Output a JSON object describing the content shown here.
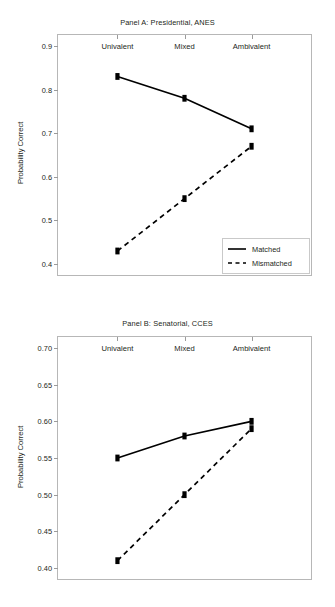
{
  "figure": {
    "background": "#ffffff",
    "line_color": "#000000",
    "axis_color": "#b7b7b7"
  },
  "panels": [
    {
      "id": "panel-a",
      "title": "Panel A: Presidential, ANES",
      "ylabel": "Probability Correct",
      "legend": {
        "matched_label": "Matched",
        "mismatched_label": "Mismatched"
      }
    },
    {
      "id": "panel-b",
      "title": "Panel B: Senatorial, CCES",
      "ylabel": "Probability Correct",
      "legend": null
    }
  ],
  "chart_data": [
    {
      "type": "line",
      "panel": "A",
      "title": "Panel A: Presidential, ANES",
      "xlabel": "",
      "ylabel": "Probability Correct",
      "categories": [
        "Univalent",
        "Mixed",
        "Ambivalent"
      ],
      "ylim": [
        0.375,
        0.925
      ],
      "yticks": [
        0.4,
        0.5,
        0.6,
        0.7,
        0.8,
        0.9
      ],
      "ytick_labels": [
        "0.4",
        "0.5",
        "0.6",
        "0.7",
        "0.8",
        "0.9"
      ],
      "grid": false,
      "legend_position": "bottom-right",
      "series": [
        {
          "name": "Matched",
          "style": "solid",
          "marker": "square",
          "values": [
            0.83,
            0.78,
            0.71
          ]
        },
        {
          "name": "Mismatched",
          "style": "dashed",
          "marker": "square",
          "values": [
            0.43,
            0.55,
            0.67
          ]
        }
      ]
    },
    {
      "type": "line",
      "panel": "B",
      "title": "Panel B: Senatorial, CCES",
      "xlabel": "",
      "ylabel": "Probability Correct",
      "categories": [
        "Univalent",
        "Mixed",
        "Ambivalent"
      ],
      "ylim": [
        0.385,
        0.715
      ],
      "yticks": [
        0.4,
        0.45,
        0.5,
        0.55,
        0.6,
        0.65,
        0.7
      ],
      "ytick_labels": [
        "0.40",
        "0.45",
        "0.50",
        "0.55",
        "0.60",
        "0.65",
        "0.70"
      ],
      "grid": false,
      "legend_position": "none",
      "series": [
        {
          "name": "Matched",
          "style": "solid",
          "marker": "square",
          "values": [
            0.55,
            0.58,
            0.6
          ]
        },
        {
          "name": "Mismatched",
          "style": "dashed",
          "marker": "square",
          "values": [
            0.41,
            0.5,
            0.59
          ]
        }
      ]
    }
  ]
}
